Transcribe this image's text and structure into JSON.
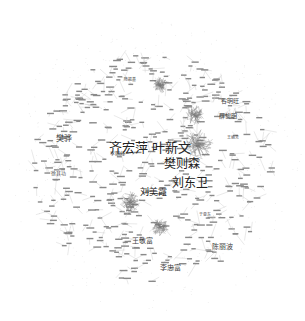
{
  "diagram": {
    "type": "co-authorship-network",
    "background": "#ffffff",
    "edge_color": "#c8c8c8",
    "node_color": "#d8d8d8",
    "label_color": "#333333",
    "major_nodes": [
      {
        "label": "齐宏萍 叶新文",
        "x": 150,
        "y": 147,
        "size": 13
      },
      {
        "label": "樊则森",
        "x": 182,
        "y": 164,
        "size": 12
      },
      {
        "label": "刘东卫",
        "x": 190,
        "y": 183,
        "size": 12
      },
      {
        "label": "刘美霞",
        "x": 153,
        "y": 192,
        "size": 9
      },
      {
        "label": "樊骅",
        "x": 64,
        "y": 139,
        "size": 8
      },
      {
        "label": "谷明旺",
        "x": 230,
        "y": 101,
        "size": 6
      },
      {
        "label": "薛黎明",
        "x": 228,
        "y": 116,
        "size": 6
      },
      {
        "label": "王敬富",
        "x": 142,
        "y": 241,
        "size": 7
      },
      {
        "label": "陈丽波",
        "x": 222,
        "y": 247,
        "size": 7
      },
      {
        "label": "李忠富",
        "x": 170,
        "y": 268,
        "size": 7
      },
      {
        "label": "李丽红",
        "x": 117,
        "y": 153,
        "size": 5
      },
      {
        "label": "徐其功",
        "x": 58,
        "y": 173,
        "size": 5
      },
      {
        "label": "于亚东",
        "x": 205,
        "y": 215,
        "size": 4
      },
      {
        "label": "陈振基",
        "x": 130,
        "y": 80,
        "size": 4
      },
      {
        "label": "王丽芳",
        "x": 233,
        "y": 138,
        "size": 4
      }
    ],
    "clusters": [
      {
        "x": 198,
        "y": 145,
        "r": 16
      },
      {
        "x": 130,
        "y": 202,
        "r": 11
      },
      {
        "x": 195,
        "y": 115,
        "r": 10
      },
      {
        "x": 160,
        "y": 227,
        "r": 9
      },
      {
        "x": 160,
        "y": 85,
        "r": 8
      }
    ]
  }
}
